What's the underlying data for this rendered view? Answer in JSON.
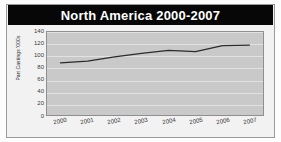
{
  "chart_data": {
    "type": "line",
    "title": "North America 2000-2007",
    "xlabel": "",
    "ylabel": "Part Castings '000s",
    "categories": [
      "2000",
      "2001",
      "2002",
      "2003",
      "2004",
      "2005",
      "2006",
      "2007"
    ],
    "values": [
      88,
      91,
      98,
      104,
      109,
      107,
      117,
      118
    ],
    "series": [
      {
        "name": "Part Castings",
        "values": [
          88,
          91,
          98,
          104,
          109,
          107,
          117,
          118
        ]
      }
    ],
    "ylim": [
      0,
      140
    ],
    "yticks": [
      0,
      20,
      40,
      60,
      80,
      100,
      120,
      140
    ],
    "ytick_labels": [
      "0",
      "20",
      "40",
      "60",
      "80",
      "100",
      "120",
      "140"
    ],
    "xticks": [
      "2000",
      "2001",
      "2002",
      "2003",
      "2004",
      "2005",
      "2006",
      "2007"
    ],
    "grid": true,
    "legend": false,
    "legend_position": "none",
    "colors": {
      "title_bar_background": "#070707",
      "title_text": "#ffffff",
      "plot_background": "#c9c9c9",
      "figure_background": "#f2f2f2",
      "line": "#2b2b2b",
      "gridline": "#e2e2e2",
      "axis_border": "#8f8f8f",
      "tick_text": "#3a3a3a"
    }
  }
}
